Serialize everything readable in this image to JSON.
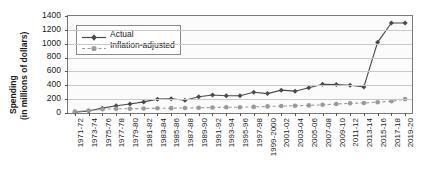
{
  "chart_data": {
    "type": "line",
    "title": "",
    "xlabel": "",
    "ylabel_line1": "Spending",
    "ylabel_line2": "(in millions of dollars)",
    "ylim": [
      0,
      1400
    ],
    "ytick_values": [
      0,
      200,
      400,
      600,
      800,
      1000,
      1200,
      1400
    ],
    "ytick_labels": [
      "0",
      "200",
      "400",
      "600",
      "800",
      "1000",
      "1200",
      "1400"
    ],
    "grid": true,
    "legend_position": "top-left",
    "categories": [
      "1971-72",
      "1973-74",
      "1975-76",
      "1977-78",
      "1979-80",
      "1981-82",
      "1983-84",
      "1985-86",
      "1987-88",
      "1989-90",
      "1991-92",
      "1993-94",
      "1995-96",
      "1997-98",
      "1999-2000",
      "2001-02",
      "2003-04",
      "2005-06",
      "2007-08",
      "2009-10",
      "2011-12",
      "2013-14",
      "2015-16",
      "2017-18",
      "2019-20"
    ],
    "series": [
      {
        "name": "Actual",
        "color": "#4a4a4a",
        "marker": "diamond",
        "linestyle": "solid",
        "values": [
          10,
          30,
          70,
          105,
          130,
          160,
          200,
          205,
          185,
          235,
          260,
          250,
          250,
          300,
          280,
          330,
          315,
          365,
          415,
          410,
          400,
          375,
          1020,
          1300,
          1300
        ]
      },
      {
        "name": "Inflation-adjusted",
        "color": "#9a9a9a",
        "marker": "circle",
        "linestyle": "dashed",
        "values": [
          20,
          35,
          55,
          60,
          62,
          65,
          68,
          70,
          72,
          75,
          80,
          82,
          84,
          88,
          95,
          100,
          105,
          110,
          118,
          130,
          140,
          145,
          155,
          170,
          200
        ]
      }
    ]
  },
  "legend": {
    "items": [
      {
        "label": "Actual"
      },
      {
        "label": "Inflation-adjusted"
      }
    ]
  }
}
